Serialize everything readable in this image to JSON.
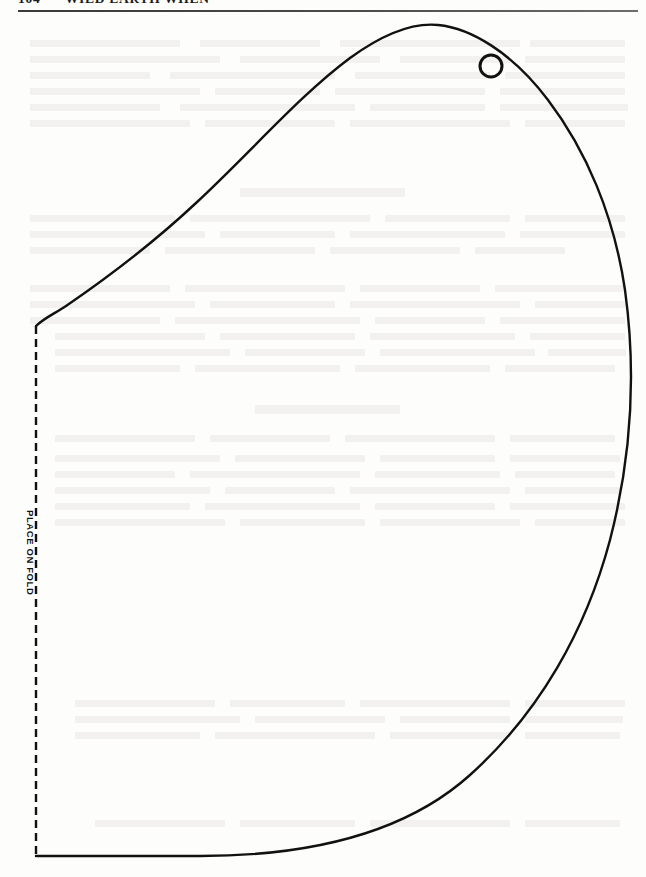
{
  "page": {
    "width": 646,
    "height": 877,
    "background_color": "#fdfdfc",
    "ink_color": "#111111"
  },
  "header": {
    "folio": "104",
    "separator": "•",
    "title": "WILD EARTH WHEN",
    "rule_color": "#3a3a3a"
  },
  "pattern": {
    "name": "leaf-pattern-template",
    "fold_label": "PLACE ON FOLD",
    "fold_line_style": "dashed",
    "fold_line_color": "#111111",
    "outline_color": "#111111",
    "outline_width": 2.4,
    "hole_marker": {
      "name": "punch-hole",
      "center_x": 491,
      "center_y": 66,
      "radius": 11,
      "stroke_width": 3
    },
    "outline_path": "M 36,326 C 44,318 54,314 66,306 C 104,280 150,246 196,203 C 250,153 300,95 350,58 C 390,29 418,23 438,25 C 470,28 512,52 548,100 C 586,150 614,215 625,290 C 636,370 632,455 610,540 C 586,630 540,712 470,775 C 400,838 300,856 200,856 L 36,856",
    "fold_line": {
      "x": 36,
      "y_top": 326,
      "y_bottom": 856
    }
  },
  "ghost_text": {
    "description": "faint bleed-through text from reverse of page",
    "opacity": 0.055,
    "blocks": [
      {
        "x": 30,
        "y": 40,
        "w": 150
      },
      {
        "x": 200,
        "y": 40,
        "w": 120
      },
      {
        "x": 340,
        "y": 40,
        "w": 180
      },
      {
        "x": 530,
        "y": 40,
        "w": 95
      },
      {
        "x": 30,
        "y": 56,
        "w": 190
      },
      {
        "x": 240,
        "y": 56,
        "w": 140
      },
      {
        "x": 400,
        "y": 56,
        "w": 110
      },
      {
        "x": 525,
        "y": 56,
        "w": 100
      },
      {
        "x": 30,
        "y": 72,
        "w": 120
      },
      {
        "x": 170,
        "y": 72,
        "w": 165
      },
      {
        "x": 355,
        "y": 72,
        "w": 135
      },
      {
        "x": 505,
        "y": 72,
        "w": 120
      },
      {
        "x": 30,
        "y": 88,
        "w": 170
      },
      {
        "x": 215,
        "y": 88,
        "w": 105
      },
      {
        "x": 335,
        "y": 88,
        "w": 150
      },
      {
        "x": 500,
        "y": 88,
        "w": 125
      },
      {
        "x": 30,
        "y": 104,
        "w": 130
      },
      {
        "x": 180,
        "y": 104,
        "w": 175
      },
      {
        "x": 370,
        "y": 104,
        "w": 115
      },
      {
        "x": 500,
        "y": 104,
        "w": 128
      },
      {
        "x": 30,
        "y": 120,
        "w": 160
      },
      {
        "x": 205,
        "y": 120,
        "w": 130
      },
      {
        "x": 350,
        "y": 120,
        "w": 160
      },
      {
        "x": 525,
        "y": 120,
        "w": 100
      },
      {
        "x": 30,
        "y": 215,
        "w": 145
      },
      {
        "x": 190,
        "y": 215,
        "w": 180
      },
      {
        "x": 385,
        "y": 215,
        "w": 125
      },
      {
        "x": 525,
        "y": 215,
        "w": 100
      },
      {
        "x": 30,
        "y": 231,
        "w": 175
      },
      {
        "x": 220,
        "y": 231,
        "w": 115
      },
      {
        "x": 350,
        "y": 231,
        "w": 155
      },
      {
        "x": 520,
        "y": 231,
        "w": 105
      },
      {
        "x": 30,
        "y": 247,
        "w": 120
      },
      {
        "x": 165,
        "y": 247,
        "w": 150
      },
      {
        "x": 330,
        "y": 247,
        "w": 130
      },
      {
        "x": 475,
        "y": 247,
        "w": 90
      },
      {
        "x": 30,
        "y": 285,
        "w": 140
      },
      {
        "x": 185,
        "y": 285,
        "w": 160
      },
      {
        "x": 360,
        "y": 285,
        "w": 120
      },
      {
        "x": 495,
        "y": 285,
        "w": 130
      },
      {
        "x": 30,
        "y": 301,
        "w": 165
      },
      {
        "x": 210,
        "y": 301,
        "w": 125
      },
      {
        "x": 350,
        "y": 301,
        "w": 170
      },
      {
        "x": 535,
        "y": 301,
        "w": 90
      },
      {
        "x": 30,
        "y": 317,
        "w": 130
      },
      {
        "x": 175,
        "y": 317,
        "w": 185
      },
      {
        "x": 375,
        "y": 317,
        "w": 110
      },
      {
        "x": 500,
        "y": 317,
        "w": 125
      },
      {
        "x": 55,
        "y": 333,
        "w": 150
      },
      {
        "x": 220,
        "y": 333,
        "w": 135
      },
      {
        "x": 370,
        "y": 333,
        "w": 145
      },
      {
        "x": 530,
        "y": 333,
        "w": 95
      },
      {
        "x": 55,
        "y": 349,
        "w": 175
      },
      {
        "x": 245,
        "y": 349,
        "w": 120
      },
      {
        "x": 380,
        "y": 349,
        "w": 155
      },
      {
        "x": 548,
        "y": 349,
        "w": 78
      },
      {
        "x": 55,
        "y": 365,
        "w": 125
      },
      {
        "x": 195,
        "y": 365,
        "w": 145
      },
      {
        "x": 355,
        "y": 365,
        "w": 135
      },
      {
        "x": 505,
        "y": 365,
        "w": 110
      },
      {
        "x": 55,
        "y": 435,
        "w": 140
      },
      {
        "x": 210,
        "y": 435,
        "w": 120
      },
      {
        "x": 345,
        "y": 435,
        "w": 150
      },
      {
        "x": 510,
        "y": 435,
        "w": 105
      },
      {
        "x": 55,
        "y": 455,
        "w": 165
      },
      {
        "x": 235,
        "y": 455,
        "w": 130
      },
      {
        "x": 380,
        "y": 455,
        "w": 115
      },
      {
        "x": 510,
        "y": 455,
        "w": 110
      },
      {
        "x": 55,
        "y": 471,
        "w": 120
      },
      {
        "x": 190,
        "y": 471,
        "w": 170
      },
      {
        "x": 375,
        "y": 471,
        "w": 125
      },
      {
        "x": 515,
        "y": 471,
        "w": 100
      },
      {
        "x": 55,
        "y": 487,
        "w": 155
      },
      {
        "x": 225,
        "y": 487,
        "w": 110
      },
      {
        "x": 350,
        "y": 487,
        "w": 160
      },
      {
        "x": 525,
        "y": 487,
        "w": 95
      },
      {
        "x": 55,
        "y": 503,
        "w": 135
      },
      {
        "x": 205,
        "y": 503,
        "w": 155
      },
      {
        "x": 375,
        "y": 503,
        "w": 120
      },
      {
        "x": 510,
        "y": 503,
        "w": 115
      },
      {
        "x": 55,
        "y": 519,
        "w": 170
      },
      {
        "x": 240,
        "y": 519,
        "w": 125
      },
      {
        "x": 380,
        "y": 519,
        "w": 140
      },
      {
        "x": 535,
        "y": 519,
        "w": 90
      },
      {
        "x": 75,
        "y": 700,
        "w": 140
      },
      {
        "x": 230,
        "y": 700,
        "w": 115
      },
      {
        "x": 360,
        "y": 700,
        "w": 150
      },
      {
        "x": 525,
        "y": 700,
        "w": 100
      },
      {
        "x": 75,
        "y": 716,
        "w": 165
      },
      {
        "x": 255,
        "y": 716,
        "w": 130
      },
      {
        "x": 400,
        "y": 716,
        "w": 110
      },
      {
        "x": 525,
        "y": 716,
        "w": 98
      },
      {
        "x": 75,
        "y": 732,
        "w": 125
      },
      {
        "x": 215,
        "y": 732,
        "w": 160
      },
      {
        "x": 390,
        "y": 732,
        "w": 120
      },
      {
        "x": 525,
        "y": 732,
        "w": 95
      },
      {
        "x": 95,
        "y": 820,
        "w": 130
      },
      {
        "x": 240,
        "y": 820,
        "w": 115
      },
      {
        "x": 370,
        "y": 820,
        "w": 140
      },
      {
        "x": 525,
        "y": 820,
        "w": 95
      }
    ],
    "headings": [
      {
        "x": 240,
        "y": 188,
        "w": 165
      },
      {
        "x": 255,
        "y": 405,
        "w": 145
      }
    ]
  }
}
